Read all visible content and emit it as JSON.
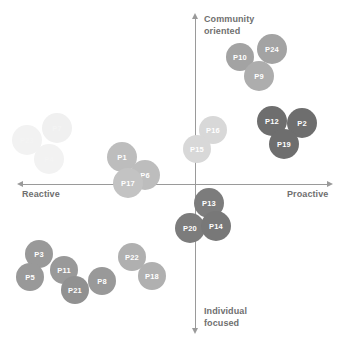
{
  "chart_data": {
    "type": "scatter",
    "title": "",
    "subtitle": "",
    "xlabel": "",
    "ylabel": "",
    "xlim": [
      -100,
      100
    ],
    "ylim": [
      -100,
      100
    ],
    "grid": false,
    "legend": "none",
    "axis_labels": {
      "top": "Community\noriented",
      "bottom": "Individual\nfocused",
      "left": "Reactive",
      "right": "Proactive"
    },
    "quadrants": [
      "Reactive / Community oriented",
      "Proactive / Community oriented",
      "Reactive / Individual focused",
      "Proactive / Individual focused"
    ],
    "color_tiers": {
      "faint": "#f2f2f2",
      "light": "#d4d4d4",
      "medium_light": "#bdbdbd",
      "medium": "#a3a3a3",
      "dark": "#8a8a8a",
      "darkest": "#6e6e6e"
    },
    "points": [
      {
        "label": "P23",
        "x": -79,
        "y": 40,
        "px": 27,
        "py": 140,
        "r": 15,
        "color": "#f2f2f2",
        "tier": "faint"
      },
      {
        "label": "P7",
        "x": -67,
        "y": 48,
        "px": 57,
        "py": 128,
        "r": 15,
        "color": "#f0f0f0",
        "tier": "faint"
      },
      {
        "label": "P4",
        "x": -72,
        "y": 30,
        "px": 49,
        "py": 159,
        "r": 15,
        "color": "#f2f2f2",
        "tier": "faint"
      },
      {
        "label": "P1",
        "x": -31,
        "y": 14,
        "px": 122,
        "py": 157,
        "r": 15,
        "color": "#bdbdbd",
        "tier": "medium_light"
      },
      {
        "label": "P6",
        "x": -19,
        "y": 3,
        "px": 145,
        "py": 175,
        "r": 15,
        "color": "#bdbdbd",
        "tier": "medium_light"
      },
      {
        "label": "P17",
        "x": -28,
        "y": -3,
        "px": 128,
        "py": 183,
        "r": 15,
        "color": "#c3c3c3",
        "tier": "medium_light"
      },
      {
        "label": "P16",
        "x": 9,
        "y": 23,
        "px": 213,
        "py": 130,
        "r": 14,
        "color": "#d8d8d8",
        "tier": "light"
      },
      {
        "label": "P15",
        "x": 2,
        "y": 14,
        "px": 197,
        "py": 149,
        "r": 14,
        "color": "#d8d8d8",
        "tier": "light"
      },
      {
        "label": "P10",
        "x": 48,
        "y": 66,
        "px": 240,
        "py": 57,
        "r": 14,
        "color": "#a3a3a3",
        "tier": "medium"
      },
      {
        "label": "P24",
        "x": 64,
        "y": 71,
        "px": 272,
        "py": 49,
        "r": 15,
        "color": "#a3a3a3",
        "tier": "medium"
      },
      {
        "label": "P9",
        "x": 58,
        "y": 56,
        "px": 259,
        "py": 76,
        "r": 15,
        "color": "#adadad",
        "tier": "medium"
      },
      {
        "label": "P12",
        "x": 64,
        "y": 30,
        "px": 272,
        "py": 121,
        "r": 15,
        "color": "#6e6e6e",
        "tier": "darkest"
      },
      {
        "label": "P2",
        "x": 78,
        "y": 29,
        "px": 302,
        "py": 123,
        "r": 15,
        "color": "#6e6e6e",
        "tier": "darkest"
      },
      {
        "label": "P19",
        "x": 69,
        "y": 19,
        "px": 284,
        "py": 144,
        "r": 15,
        "color": "#6e6e6e",
        "tier": "darkest"
      },
      {
        "label": "P13",
        "x": 7,
        "y": -19,
        "px": 209,
        "py": 203,
        "r": 15,
        "color": "#7c7c7c",
        "tier": "darkest"
      },
      {
        "label": "P20",
        "x": -2,
        "y": -30,
        "px": 190,
        "py": 228,
        "r": 15,
        "color": "#7c7c7c",
        "tier": "darkest"
      },
      {
        "label": "P14",
        "x": 10,
        "y": -29,
        "px": 216,
        "py": 226,
        "r": 15,
        "color": "#787878",
        "tier": "darkest"
      },
      {
        "label": "P3",
        "x": -74,
        "y": -42,
        "px": 39,
        "py": 254,
        "r": 14,
        "color": "#999999",
        "tier": "medium"
      },
      {
        "label": "P11",
        "x": -63,
        "y": -49,
        "px": 64,
        "py": 270,
        "r": 14,
        "color": "#999999",
        "tier": "medium"
      },
      {
        "label": "P5",
        "x": -79,
        "y": -52,
        "px": 30,
        "py": 277,
        "r": 14,
        "color": "#999999",
        "tier": "medium"
      },
      {
        "label": "P21",
        "x": -57,
        "y": -62,
        "px": 75,
        "py": 290,
        "r": 14,
        "color": "#919191",
        "tier": "medium"
      },
      {
        "label": "P8",
        "x": -45,
        "y": -57,
        "px": 102,
        "py": 281,
        "r": 14,
        "color": "#999999",
        "tier": "medium"
      },
      {
        "label": "P22",
        "x": -27,
        "y": -44,
        "px": 132,
        "py": 257,
        "r": 14,
        "color": "#b0b0b0",
        "tier": "medium"
      },
      {
        "label": "P18",
        "x": -18,
        "y": -54,
        "px": 152,
        "py": 276,
        "r": 14,
        "color": "#b0b0b0",
        "tier": "medium"
      }
    ]
  }
}
